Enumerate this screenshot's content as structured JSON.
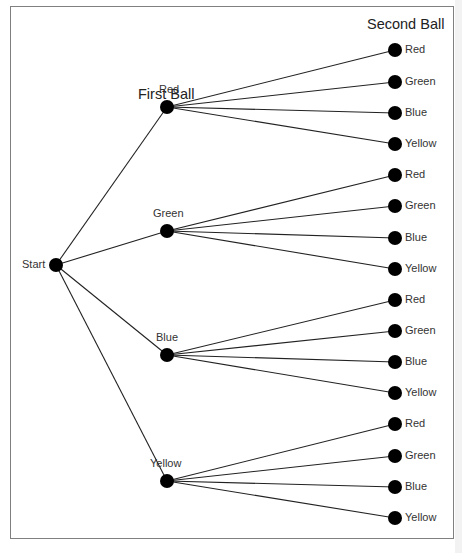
{
  "diagram": {
    "type": "tree",
    "first_heading": "First Ball",
    "second_heading": "Second Ball",
    "root": {
      "label": "Start",
      "x": 56,
      "y": 265
    },
    "colors": {
      "line": "#222222",
      "node": "#000000",
      "frame": "#808080",
      "text": "#333333"
    },
    "first_level": [
      {
        "label": "Red",
        "x": 167,
        "y": 107,
        "children": [
          {
            "label": "Red",
            "y": 50
          },
          {
            "label": "Green",
            "y": 82
          },
          {
            "label": "Blue",
            "y": 113
          },
          {
            "label": "Yellow",
            "y": 144
          }
        ]
      },
      {
        "label": "Green",
        "x": 167,
        "y": 231,
        "children": [
          {
            "label": "Red",
            "y": 175
          },
          {
            "label": "Green",
            "y": 206
          },
          {
            "label": "Blue",
            "y": 238
          },
          {
            "label": "Yellow",
            "y": 269
          }
        ]
      },
      {
        "label": "Blue",
        "x": 167,
        "y": 355,
        "children": [
          {
            "label": "Red",
            "y": 300
          },
          {
            "label": "Green",
            "y": 331
          },
          {
            "label": "Blue",
            "y": 362
          },
          {
            "label": "Yellow",
            "y": 393
          }
        ]
      },
      {
        "label": "Yellow",
        "x": 167,
        "y": 481,
        "children": [
          {
            "label": "Red",
            "y": 424
          },
          {
            "label": "Green",
            "y": 456
          },
          {
            "label": "Blue",
            "y": 487
          },
          {
            "label": "Yellow",
            "y": 518
          }
        ]
      }
    ],
    "second_level_x": 395
  }
}
